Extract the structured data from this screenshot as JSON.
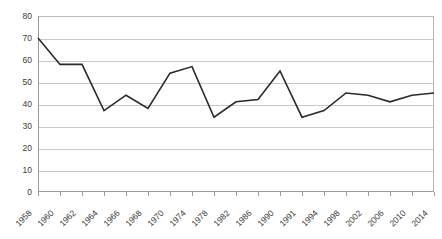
{
  "chart_data": {
    "type": "line",
    "title": "",
    "subtitle": "",
    "xlabel": "",
    "ylabel": "",
    "categories": [
      "1958",
      "1960",
      "1962",
      "1964",
      "1966",
      "1968",
      "1970",
      "1974",
      "1978",
      "1982",
      "1986",
      "1990",
      "1991",
      "1994",
      "1998",
      "2002",
      "2006",
      "2010",
      "2014"
    ],
    "values": [
      70,
      58,
      58,
      37,
      44,
      38,
      54,
      57,
      34,
      41,
      42,
      55,
      34,
      37,
      45,
      44,
      41,
      44,
      45
    ],
    "series": [
      {
        "name": "series-1",
        "values": [
          70,
          58,
          58,
          37,
          44,
          38,
          54,
          57,
          34,
          41,
          42,
          55,
          34,
          37,
          45,
          44,
          41,
          44,
          45
        ],
        "color": "#2a2a2a"
      }
    ],
    "ylim": [
      0,
      80
    ],
    "ytick_labels": [
      "0",
      "10",
      "20",
      "30",
      "40",
      "50",
      "60",
      "70",
      "80"
    ],
    "ytick_values": [
      0,
      10,
      20,
      30,
      40,
      50,
      60,
      70,
      80
    ],
    "grid": "horizontal",
    "legend": "none",
    "xlabel_rotation": -45,
    "annotations": []
  },
  "colors": {
    "line": "#2a2a2a",
    "gridline": "#c9c9c9",
    "axis": "#9a9a9a",
    "text": "#3a3a3a",
    "background": "#ffffff"
  }
}
